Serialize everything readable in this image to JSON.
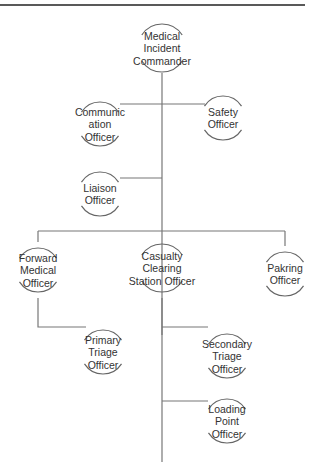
{
  "diagram": {
    "type": "organization-chart",
    "title": "",
    "nodes": [
      {
        "id": "mic",
        "label_lines": [
          "Medical",
          "Incident",
          "Commander"
        ]
      },
      {
        "id": "comm",
        "label_lines": [
          "Communic",
          "ation",
          "Officer"
        ]
      },
      {
        "id": "safety",
        "label_lines": [
          "Safety",
          "Officer"
        ]
      },
      {
        "id": "liaison",
        "label_lines": [
          "Liaison",
          "Officer"
        ]
      },
      {
        "id": "fmo",
        "label_lines": [
          "Forward",
          "Medical",
          "Officer"
        ]
      },
      {
        "id": "ccso",
        "label_lines": [
          "Casualty",
          "Clearing",
          "Station Officer"
        ]
      },
      {
        "id": "parking",
        "label_lines": [
          "Pakring",
          "Officer"
        ]
      },
      {
        "id": "pto",
        "label_lines": [
          "Primary",
          "Triage",
          "Officer"
        ]
      },
      {
        "id": "sto",
        "label_lines": [
          "Secondary",
          "Triage",
          "Officer"
        ]
      },
      {
        "id": "lpo",
        "label_lines": [
          "Loading",
          "Point",
          "Officer"
        ]
      }
    ],
    "edges": [
      {
        "from": "mic",
        "to": "comm"
      },
      {
        "from": "mic",
        "to": "safety"
      },
      {
        "from": "mic",
        "to": "liaison"
      },
      {
        "from": "mic",
        "to": "fmo"
      },
      {
        "from": "mic",
        "to": "ccso"
      },
      {
        "from": "mic",
        "to": "parking"
      },
      {
        "from": "fmo",
        "to": "pto"
      },
      {
        "from": "ccso",
        "to": "sto"
      },
      {
        "from": "ccso",
        "to": "lpo"
      }
    ]
  }
}
